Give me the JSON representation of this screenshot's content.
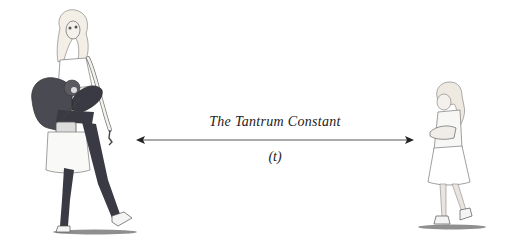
{
  "illustration": {
    "title": "The Tantrum Constant",
    "variable": "(t)",
    "left_figure": "exhausted-mother-carrying-child-and-bags",
    "right_figure": "pouting-child-arms-crossed",
    "colors": {
      "ink": "#222222",
      "pants": "#3a3a44",
      "jacket": "#4a4a52",
      "background": "#ffffff"
    }
  }
}
